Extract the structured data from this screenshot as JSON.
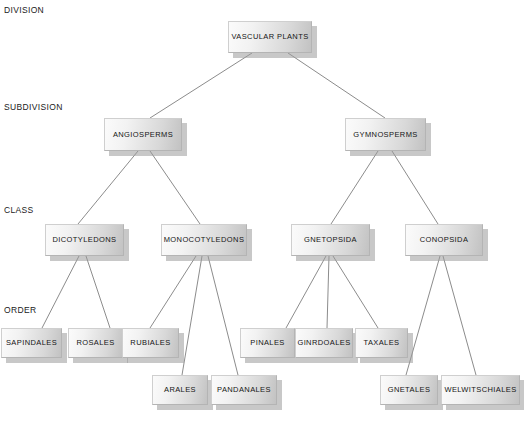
{
  "diagram": {
    "background_color": "#ffffff",
    "line_color": "#8c8c8c",
    "box_fill_light": "#fbfbfb",
    "box_fill_dark": "#c2c2c2",
    "box_border": "#b4b4b4",
    "shadow_color": "#9a9a9a",
    "text_color": "#151515"
  },
  "rank_labels": [
    {
      "text": "DIVISION",
      "x": 4,
      "y": 5
    },
    {
      "text": "SUBDIVISION",
      "x": 4,
      "y": 102
    },
    {
      "text": "CLASS",
      "x": 4,
      "y": 205
    },
    {
      "text": "ORDER",
      "x": 4,
      "y": 305
    }
  ],
  "nodes": [
    {
      "id": "vascular-plants",
      "label": "VASCULAR PLANTS",
      "rank": "DIVISION",
      "x": 228,
      "y": 21,
      "w": 84,
      "h": 32
    },
    {
      "id": "angiosperms",
      "label": "ANGIOSPERMS",
      "rank": "SUBDIVISION",
      "x": 104,
      "y": 118,
      "w": 78,
      "h": 33
    },
    {
      "id": "gymnosperms",
      "label": "GYMNOSPERMS",
      "rank": "SUBDIVISION",
      "x": 345,
      "y": 118,
      "w": 81,
      "h": 33
    },
    {
      "id": "dicotyledons",
      "label": "DICOTYLEDONS",
      "rank": "CLASS",
      "x": 45,
      "y": 224,
      "w": 79,
      "h": 32
    },
    {
      "id": "monocotyledons",
      "label": "MONOCOTYLEDONS",
      "rank": "CLASS",
      "x": 161,
      "y": 224,
      "w": 86,
      "h": 32
    },
    {
      "id": "gnetopsida",
      "label": "GNETOPSIDA",
      "rank": "CLASS",
      "x": 291,
      "y": 224,
      "w": 79,
      "h": 32
    },
    {
      "id": "conopsida",
      "label": "CONOPSIDA",
      "rank": "CLASS",
      "x": 405,
      "y": 224,
      "w": 78,
      "h": 32
    },
    {
      "id": "sapindales",
      "label": "SAPINDALES",
      "rank": "ORDER",
      "x": 1,
      "y": 328,
      "w": 61,
      "h": 30
    },
    {
      "id": "rosales",
      "label": "ROSALES",
      "rank": "ORDER",
      "x": 68,
      "y": 328,
      "w": 55,
      "h": 30
    },
    {
      "id": "rubiales",
      "label": "RUBIALES",
      "rank": "ORDER",
      "x": 122,
      "y": 328,
      "w": 57,
      "h": 30
    },
    {
      "id": "pinales",
      "label": "PINALES",
      "rank": "ORDER",
      "x": 240,
      "y": 328,
      "w": 55,
      "h": 30
    },
    {
      "id": "ginrdoales",
      "label": "GINRDOALES",
      "rank": "ORDER",
      "x": 295,
      "y": 328,
      "w": 58,
      "h": 30
    },
    {
      "id": "taxales",
      "label": "TAXALES",
      "rank": "ORDER",
      "x": 355,
      "y": 328,
      "w": 53,
      "h": 30
    },
    {
      "id": "arales",
      "label": "ARALES",
      "rank": "ORDER",
      "x": 152,
      "y": 375,
      "w": 56,
      "h": 30
    },
    {
      "id": "pandanales",
      "label": "PANDANALES",
      "rank": "ORDER",
      "x": 211,
      "y": 375,
      "w": 66,
      "h": 30
    },
    {
      "id": "gnetales",
      "label": "GNETALES",
      "rank": "ORDER",
      "x": 380,
      "y": 375,
      "w": 58,
      "h": 30
    },
    {
      "id": "welwitschiales",
      "label": "WELWITSCHIALES",
      "rank": "ORDER",
      "x": 441,
      "y": 375,
      "w": 79,
      "h": 30
    }
  ],
  "edges": [
    {
      "from": "vascular-plants",
      "to": "angiosperms",
      "x1": 252,
      "y1": 53,
      "x2": 150,
      "y2": 118
    },
    {
      "from": "vascular-plants",
      "to": "gymnosperms",
      "x1": 288,
      "y1": 53,
      "x2": 385,
      "y2": 118
    },
    {
      "from": "angiosperms",
      "to": "dicotyledons",
      "x1": 138,
      "y1": 151,
      "x2": 78,
      "y2": 224
    },
    {
      "from": "angiosperms",
      "to": "monocotyledons",
      "x1": 150,
      "y1": 151,
      "x2": 200,
      "y2": 224
    },
    {
      "from": "gymnosperms",
      "to": "gnetopsida",
      "x1": 378,
      "y1": 151,
      "x2": 331,
      "y2": 224
    },
    {
      "from": "gymnosperms",
      "to": "conopsida",
      "x1": 392,
      "y1": 151,
      "x2": 438,
      "y2": 224
    },
    {
      "from": "dicotyledons",
      "to": "sapindales",
      "x1": 79,
      "y1": 256,
      "x2": 42,
      "y2": 328
    },
    {
      "from": "dicotyledons",
      "to": "rosales",
      "x1": 86,
      "y1": 256,
      "x2": 110,
      "y2": 328
    },
    {
      "from": "monocotyledons",
      "to": "rubiales",
      "x1": 196,
      "y1": 256,
      "x2": 150,
      "y2": 328
    },
    {
      "from": "monocotyledons",
      "to": "arales",
      "x1": 202,
      "y1": 256,
      "x2": 182,
      "y2": 375
    },
    {
      "from": "monocotyledons",
      "to": "pandanales",
      "x1": 208,
      "y1": 256,
      "x2": 238,
      "y2": 375
    },
    {
      "from": "gnetopsida",
      "to": "pinales",
      "x1": 326,
      "y1": 256,
      "x2": 286,
      "y2": 328
    },
    {
      "from": "gnetopsida",
      "to": "ginrdoales",
      "x1": 329,
      "y1": 256,
      "x2": 327,
      "y2": 328
    },
    {
      "from": "gnetopsida",
      "to": "taxales",
      "x1": 333,
      "y1": 256,
      "x2": 378,
      "y2": 328
    },
    {
      "from": "conopsida",
      "to": "gnetales",
      "x1": 440,
      "y1": 256,
      "x2": 406,
      "y2": 375
    },
    {
      "from": "conopsida",
      "to": "welwitschiales",
      "x1": 443,
      "y1": 256,
      "x2": 476,
      "y2": 375
    }
  ]
}
